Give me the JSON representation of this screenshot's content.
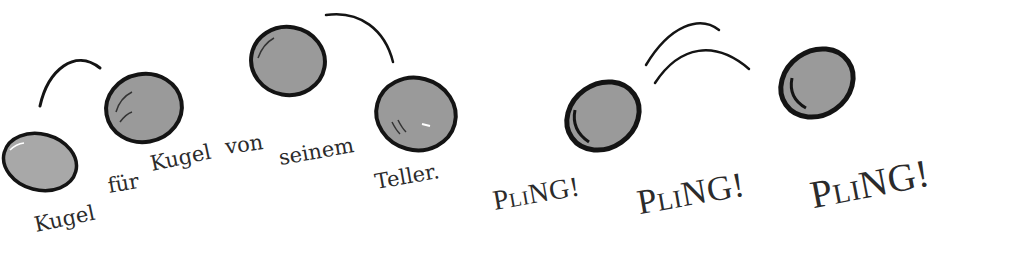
{
  "illustration": {
    "balls": [
      {
        "name": "ball-1",
        "cx": 40,
        "cy": 162,
        "rx": 36,
        "ry": 28
      },
      {
        "name": "ball-2",
        "cx": 144,
        "cy": 108,
        "rx": 38,
        "ry": 35
      },
      {
        "name": "ball-3",
        "cx": 288,
        "cy": 61,
        "rx": 37,
        "ry": 34
      },
      {
        "name": "ball-4",
        "cx": 416,
        "cy": 114,
        "rx": 40,
        "ry": 36
      },
      {
        "name": "ball-5",
        "cx": 603,
        "cy": 116,
        "rx": 37,
        "ry": 33
      },
      {
        "name": "ball-6",
        "cx": 817,
        "cy": 83,
        "rx": 37,
        "ry": 33
      }
    ],
    "colors": {
      "ball_fill": "#9a9a9a",
      "outline": "#141414",
      "text": "#2b2b2b",
      "background": "#ffffff"
    }
  },
  "sentence": {
    "words": [
      "Kugel",
      "für",
      "Kugel",
      "von",
      "seinem",
      "Teller."
    ]
  },
  "sounds": {
    "pling_1": {
      "p": "P",
      "li": "LI",
      "ng": "NG!"
    },
    "pling_2": {
      "p": "P",
      "li": "LI",
      "ng": "NG!"
    },
    "pling_3": {
      "p": "P",
      "li": "LI",
      "ng": "NG!"
    }
  }
}
